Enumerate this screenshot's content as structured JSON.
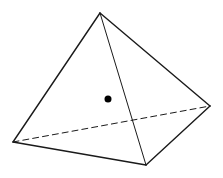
{
  "diagram": {
    "title": "",
    "shape": "tetrahedron",
    "stroke_color": "#1a1a1a",
    "dot_color": "#000000",
    "background": "#ffffff",
    "vertices": {
      "apex": [
        100,
        13
      ],
      "left": [
        13,
        142
      ],
      "bottom": [
        146,
        165
      ],
      "right": [
        210,
        106
      ]
    },
    "edges": [
      {
        "from": "apex",
        "to": "left",
        "style": "solid"
      },
      {
        "from": "apex",
        "to": "right",
        "style": "solid"
      },
      {
        "from": "apex",
        "to": "bottom",
        "style": "solid-thin"
      },
      {
        "from": "left",
        "to": "bottom",
        "style": "solid"
      },
      {
        "from": "bottom",
        "to": "right",
        "style": "solid"
      },
      {
        "from": "left",
        "to": "right",
        "style": "dashed"
      }
    ],
    "center_point": {
      "x": 108,
      "y": 99,
      "r": 3.5
    }
  }
}
